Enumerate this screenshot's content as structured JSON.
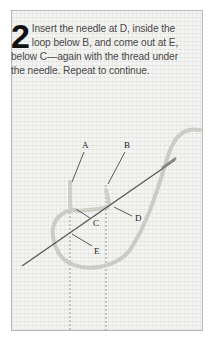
{
  "step": {
    "number": "2",
    "instruction": "Insert the needle at D, inside the loop below B, and come out at E, below C—again with the thread under the needle. Repeat to continue."
  },
  "illustration": {
    "labels": [
      "A",
      "B",
      "C",
      "D",
      "E"
    ],
    "fabric": "even-weave canvas",
    "colors": {
      "fabric": "#f4f4f2",
      "thread": "#c9c9c3",
      "needle": "#555555",
      "border": "#b8b8b8"
    }
  }
}
